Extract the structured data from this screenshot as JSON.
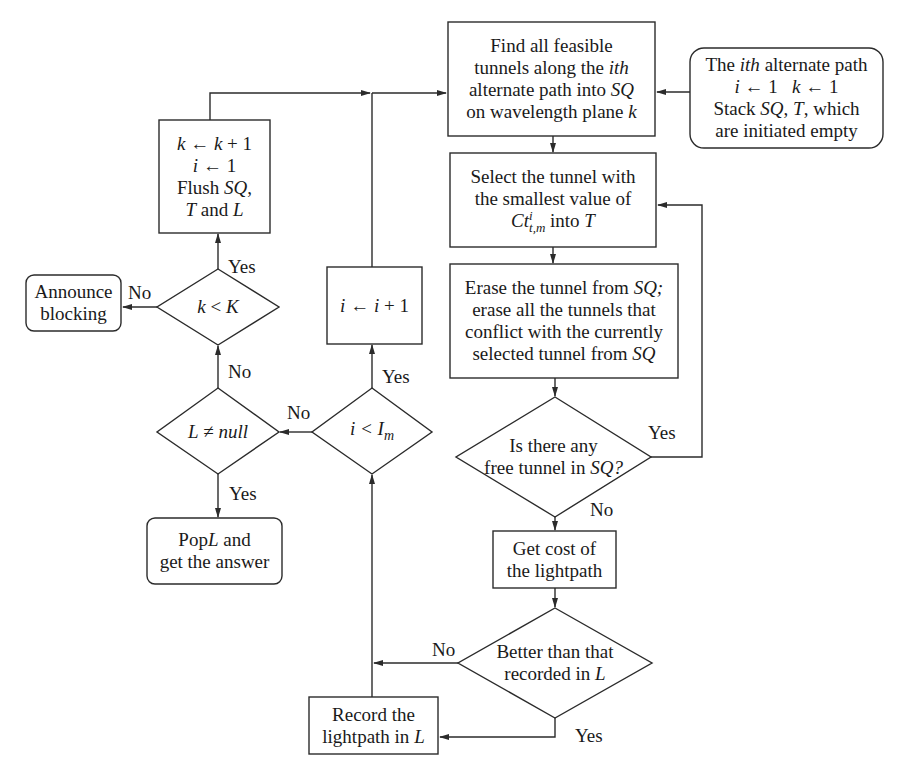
{
  "diagram": {
    "type": "flowchart",
    "nodes": {
      "start": {
        "shape": "rounded-rect",
        "lines": [
          "The ith alternate path",
          "i ← 1   k ← 1",
          "Stack SQ, T, which",
          "are initiated empty"
        ]
      },
      "find_tunnels": {
        "shape": "rect",
        "lines": [
          "Find all feasible",
          "tunnels along the ith",
          "alternate path into SQ",
          "on wavelength plane k"
        ]
      },
      "select_tunnel": {
        "shape": "rect",
        "lines": [
          "Select the tunnel with",
          "the smallest value of",
          "Ct^i_{t,m} into T"
        ],
        "formula": {
          "base": "Ct",
          "sup": "i",
          "sub": "t,m",
          "suffix": " into ",
          "var": "T"
        }
      },
      "erase_tunnel": {
        "shape": "rect",
        "lines": [
          "Erase the tunnel from SQ;",
          "erase all the tunnels that",
          "conflict with the currently",
          "selected tunnel from SQ"
        ]
      },
      "free_tunnel_check": {
        "shape": "diamond",
        "lines": [
          "Is there any",
          "free tunnel in SQ?"
        ]
      },
      "get_cost": {
        "shape": "rect",
        "lines": [
          "Get cost of",
          "the lightpath"
        ]
      },
      "better_check": {
        "shape": "diamond",
        "lines": [
          "Better than that",
          "recorded in L"
        ]
      },
      "record": {
        "shape": "rect",
        "lines": [
          "Record the",
          "lightpath in L"
        ]
      },
      "i_check": {
        "shape": "diamond",
        "lines": [
          "i < I_m"
        ],
        "formula": {
          "lhs": "i < I",
          "sub": "m"
        }
      },
      "i_increment": {
        "shape": "rect",
        "lines": [
          "i ← i + 1"
        ]
      },
      "l_check": {
        "shape": "diamond",
        "lines": [
          "L ≠ null"
        ]
      },
      "pop": {
        "shape": "rounded-rect",
        "lines": [
          "PopL and",
          "get the answer"
        ]
      },
      "k_check": {
        "shape": "diamond",
        "lines": [
          "k < K"
        ]
      },
      "k_increment": {
        "shape": "rect",
        "lines": [
          "k ← k + 1",
          "i ← 1",
          "Flush SQ,",
          "T and L"
        ]
      },
      "blocking": {
        "shape": "rounded-rect",
        "lines": [
          "Announce",
          "blocking"
        ]
      }
    },
    "edge_labels": {
      "free_yes": "Yes",
      "free_no": "No",
      "better_no": "No",
      "better_yes": "Yes",
      "i_yes": "Yes",
      "i_no": "No",
      "l_no": "No",
      "l_yes": "Yes",
      "k_yes": "Yes",
      "k_no": "No"
    },
    "edges": [
      [
        "start",
        "find_tunnels",
        ""
      ],
      [
        "find_tunnels",
        "select_tunnel",
        ""
      ],
      [
        "select_tunnel",
        "erase_tunnel",
        ""
      ],
      [
        "erase_tunnel",
        "free_tunnel_check",
        ""
      ],
      [
        "free_tunnel_check",
        "select_tunnel",
        "Yes"
      ],
      [
        "free_tunnel_check",
        "get_cost",
        "No"
      ],
      [
        "get_cost",
        "better_check",
        ""
      ],
      [
        "better_check",
        "record",
        "Yes"
      ],
      [
        "better_check",
        "i_check",
        "No"
      ],
      [
        "record",
        "i_check",
        ""
      ],
      [
        "i_check",
        "i_increment",
        "Yes"
      ],
      [
        "i_increment",
        "find_tunnels",
        ""
      ],
      [
        "i_check",
        "l_check",
        "No"
      ],
      [
        "l_check",
        "pop",
        "Yes"
      ],
      [
        "l_check",
        "k_check",
        "No"
      ],
      [
        "k_check",
        "k_increment",
        "Yes"
      ],
      [
        "k_check",
        "blocking",
        "No"
      ],
      [
        "k_increment",
        "find_tunnels",
        ""
      ]
    ],
    "stroke_color": "#2b2b2b"
  }
}
